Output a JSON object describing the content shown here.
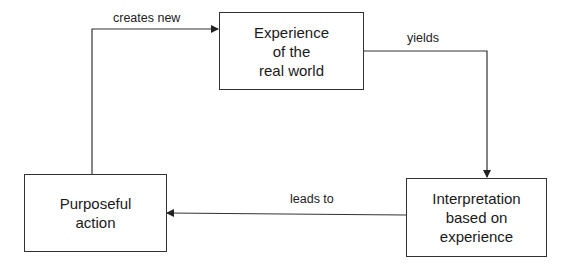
{
  "diagram": {
    "nodes": [
      {
        "id": "experience",
        "label": "Experience\nof the\nreal world"
      },
      {
        "id": "interpretation",
        "label": "Interpretation\nbased on\nexperience"
      },
      {
        "id": "action",
        "label": "Purposeful\naction"
      }
    ],
    "edges": [
      {
        "from": "experience",
        "to": "interpretation",
        "label": "yields"
      },
      {
        "from": "interpretation",
        "to": "action",
        "label": "leads to"
      },
      {
        "from": "action",
        "to": "experience",
        "label": "creates new"
      }
    ],
    "colors": {
      "line": "#333333",
      "text": "#1a1a1a",
      "background": "#ffffff"
    }
  }
}
